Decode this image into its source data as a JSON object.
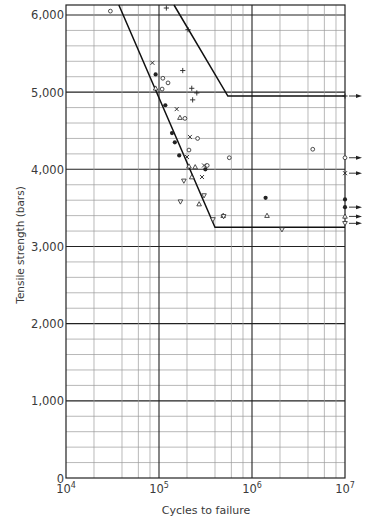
{
  "chart_data": {
    "type": "scatter",
    "title": "",
    "xlabel": "Cycles to failure",
    "ylabel": "Tensile strength (bars)",
    "xscale": "log",
    "xlim": [
      10000,
      10000000
    ],
    "ylim": [
      0,
      6150
    ],
    "grid": true,
    "x_tick_labels": [
      "10^4",
      "10^5",
      "10^6",
      "10^7"
    ],
    "y_tick_labels": [
      "0",
      "1,000",
      "2,000",
      "3,000",
      "4,000",
      "5,000",
      "6,000"
    ],
    "y_ticks": [
      0,
      1000,
      2000,
      3000,
      4000,
      5000,
      6000
    ],
    "caption_partial": "Fig. ...",
    "envelope_lines": [
      {
        "name": "lower-bound",
        "points": [
          [
            37000,
            6150
          ],
          [
            400000,
            3250
          ],
          [
            10000000,
            3250
          ]
        ]
      },
      {
        "name": "upper-bound",
        "points": [
          [
            145000,
            6150
          ],
          [
            550000,
            4950
          ],
          [
            10000000,
            4950
          ]
        ]
      }
    ],
    "series": [
      {
        "name": "open circle",
        "marker": "o",
        "points": [
          [
            30000,
            6050
          ],
          [
            110000,
            5180
          ],
          [
            125000,
            5120
          ],
          [
            108000,
            5040
          ],
          [
            190000,
            4660
          ],
          [
            260000,
            4400
          ],
          [
            210000,
            4250
          ],
          [
            330000,
            4050
          ],
          [
            570000,
            4150
          ],
          [
            4500000,
            4260
          ]
        ]
      },
      {
        "name": "cross x",
        "marker": "x",
        "points": [
          [
            85000,
            5380
          ],
          [
            155000,
            4780
          ],
          [
            215000,
            4420
          ],
          [
            200000,
            4160
          ],
          [
            305000,
            4050
          ],
          [
            290000,
            3900
          ]
        ]
      },
      {
        "name": "filled circle",
        "marker": "filled",
        "points": [
          [
            92000,
            5230
          ],
          [
            117000,
            4830
          ],
          [
            138000,
            4470
          ],
          [
            148000,
            4350
          ],
          [
            165000,
            4180
          ],
          [
            315000,
            4000
          ],
          [
            1400000,
            3630
          ]
        ]
      },
      {
        "name": "triangle up",
        "marker": "triangle",
        "points": [
          [
            92000,
            5050
          ],
          [
            168000,
            4670
          ],
          [
            210000,
            4040
          ],
          [
            245000,
            4030
          ],
          [
            225000,
            3900
          ],
          [
            270000,
            3550
          ],
          [
            490000,
            3400
          ],
          [
            1450000,
            3400
          ]
        ]
      },
      {
        "name": "triangle down",
        "marker": "triangle-down",
        "points": [
          [
            185000,
            3850
          ],
          [
            170000,
            3580
          ],
          [
            305000,
            3660
          ],
          [
            380000,
            3350
          ],
          [
            495000,
            3390
          ],
          [
            2100000,
            3220
          ]
        ]
      },
      {
        "name": "plus",
        "marker": "+",
        "points": [
          [
            120000,
            6170
          ],
          [
            205000,
            5810
          ],
          [
            180000,
            5280
          ],
          [
            225000,
            5050
          ],
          [
            230000,
            4900
          ],
          [
            255000,
            4990
          ]
        ]
      }
    ],
    "runouts_at_1e7": [
      {
        "marker": "+",
        "value": 4950,
        "arrow": true
      },
      {
        "marker": "o",
        "value": 4150,
        "arrow": true
      },
      {
        "marker": "x",
        "value": 3950,
        "arrow": true
      },
      {
        "marker": "filled",
        "value": 3610,
        "arrow": false
      },
      {
        "marker": "filled",
        "value": 3510,
        "arrow": true
      },
      {
        "marker": "triangle",
        "value": 3390,
        "arrow": true
      },
      {
        "marker": "triangle-down",
        "value": 3300,
        "arrow": true
      }
    ]
  }
}
